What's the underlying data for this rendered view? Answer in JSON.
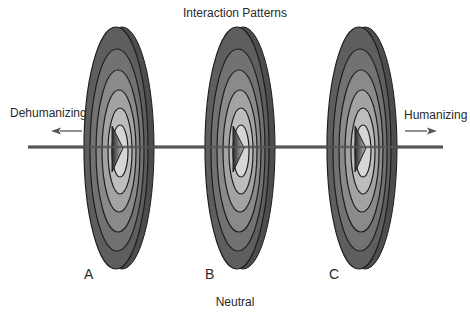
{
  "title": "Interaction Patterns",
  "axis": {
    "left_label": "Dehumanizing",
    "right_label": "Humanizing",
    "bottom_label": "Neutral"
  },
  "discs": [
    {
      "label": "A"
    },
    {
      "label": "B"
    },
    {
      "label": "C"
    }
  ],
  "colors": {
    "ring_outer": "#5a5a5a",
    "ring_2": "#6e6e6e",
    "ring_3": "#858585",
    "ring_4": "#9c9c9c",
    "ring_5": "#b5b5b5",
    "ring_inner": "#d4d4d4",
    "axis_line": "#555555",
    "triangle": "#3a3a3a"
  }
}
